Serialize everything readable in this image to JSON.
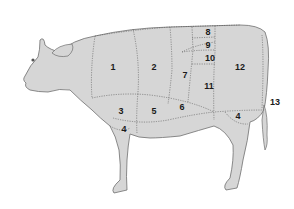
{
  "diagram": {
    "colors": {
      "body_fill": "#d6d6d6",
      "outline": "#6e6e6e",
      "cut_lines": "#5a5a5a",
      "label_text": "#1a1a1a",
      "background": "#ffffff"
    },
    "cut_labels": [
      {
        "id": "1",
        "text": "1",
        "x": 113,
        "y": 67
      },
      {
        "id": "2",
        "text": "2",
        "x": 154,
        "y": 67
      },
      {
        "id": "3",
        "text": "3",
        "x": 121,
        "y": 111
      },
      {
        "id": "4a",
        "text": "4",
        "x": 124,
        "y": 129
      },
      {
        "id": "5",
        "text": "5",
        "x": 154,
        "y": 111
      },
      {
        "id": "6",
        "text": "6",
        "x": 182,
        "y": 107
      },
      {
        "id": "7",
        "text": "7",
        "x": 185,
        "y": 75
      },
      {
        "id": "8",
        "text": "8",
        "x": 208,
        "y": 32
      },
      {
        "id": "9",
        "text": "9",
        "x": 208,
        "y": 45
      },
      {
        "id": "10",
        "text": "10",
        "x": 210,
        "y": 58
      },
      {
        "id": "11",
        "text": "11",
        "x": 209,
        "y": 86
      },
      {
        "id": "12",
        "text": "12",
        "x": 240,
        "y": 67
      },
      {
        "id": "4b",
        "text": "4",
        "x": 238,
        "y": 116
      },
      {
        "id": "13",
        "text": "13",
        "x": 275,
        "y": 102
      }
    ]
  }
}
